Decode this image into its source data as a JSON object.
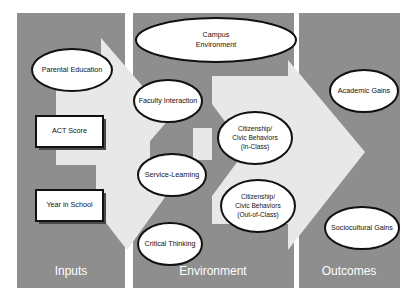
{
  "diagram": {
    "background_color": "#ffffff",
    "panel_fill_color": "#8e8e8e",
    "arrow_fill_color": "#e8e8e8",
    "node_fill_color": "#ffffff",
    "outline_color": "#111111",
    "panel_label_color": "#ffffff",
    "panels": [
      {
        "id": "inputs",
        "label": "Inputs",
        "x": 17,
        "y": 13,
        "width": 108,
        "height": 275
      },
      {
        "id": "environment",
        "label": "Environment",
        "x": 133,
        "y": 13,
        "width": 161,
        "height": 275
      },
      {
        "id": "outcomes",
        "label": "Outcomes",
        "x": 299,
        "y": 13,
        "width": 101,
        "height": 275
      }
    ],
    "arrows": [
      {
        "id": "inputs-to-environment-arrow",
        "label": "arrow from Inputs to Environment"
      },
      {
        "id": "environment-to-outcomes-arrow",
        "label": "arrow from Environment to Outcomes"
      }
    ],
    "nodes": [
      {
        "id": "parental-education",
        "shape": "ellipse",
        "panel": "inputs",
        "lines": [
          "Parental Education"
        ],
        "cx": 72,
        "cy": 70,
        "rx": 40,
        "ry": 21,
        "font_size": 7.2
      },
      {
        "id": "act-score",
        "shape": "rect",
        "panel": "inputs",
        "lines": [
          "ACT Score"
        ],
        "x": 36,
        "y": 116,
        "width": 67,
        "height": 31,
        "font_size": 7.2
      },
      {
        "id": "year-in-school",
        "shape": "rect",
        "panel": "inputs",
        "lines": [
          "Year in School"
        ],
        "x": 36,
        "y": 190,
        "width": 67,
        "height": 31,
        "font_size": 7.2
      },
      {
        "id": "campus-environment",
        "shape": "ellipse",
        "panel": "environment",
        "lines": [
          "Campus",
          "Environment"
        ],
        "cx": 216,
        "cy": 40,
        "rx": 80,
        "ry": 22,
        "font_size": 7.2
      },
      {
        "id": "faculty-interaction",
        "shape": "ellipse",
        "panel": "environment",
        "lines": [
          "Faculty Interaction"
        ],
        "cx": 168,
        "cy": 101,
        "rx": 34,
        "ry": 21,
        "font_size": 7.2
      },
      {
        "id": "service-learning",
        "shape": "ellipse",
        "panel": "environment",
        "lines": [
          "Service-Learning"
        ],
        "cx": 172,
        "cy": 175,
        "rx": 34,
        "ry": 21,
        "font_size": 7.2
      },
      {
        "id": "critical-thinking",
        "shape": "ellipse",
        "panel": "environment",
        "lines": [
          "Critical Thinking"
        ],
        "cx": 170,
        "cy": 244,
        "rx": 32,
        "ry": 21,
        "font_size": 7.2
      },
      {
        "id": "citizenship-civic-behaviors-in-class",
        "shape": "ellipse",
        "panel": "environment",
        "lines": [
          "Citizenship/",
          "Civic Behaviors",
          "(In-Class)"
        ],
        "cx": 255,
        "cy": 138,
        "rx": 37,
        "ry": 26,
        "font_size": 6.6
      },
      {
        "id": "citizenship-civic-behaviors-out-of-class",
        "shape": "ellipse",
        "panel": "environment",
        "lines": [
          "Citizenship/",
          "Civic Behaviors",
          "(Out-of-Class)"
        ],
        "cx": 258,
        "cy": 206,
        "rx": 37,
        "ry": 26,
        "font_size": 6.6
      },
      {
        "id": "academic-gains",
        "shape": "ellipse",
        "panel": "outcomes",
        "lines": [
          "Academic Gains"
        ],
        "cx": 364,
        "cy": 91,
        "rx": 34,
        "ry": 21,
        "font_size": 7.2
      },
      {
        "id": "sociocultural-gains",
        "shape": "ellipse",
        "panel": "outcomes",
        "lines": [
          "Sociocultural Gains"
        ],
        "cx": 362,
        "cy": 228,
        "rx": 37,
        "ry": 21,
        "font_size": 7.2
      }
    ],
    "panel_label_positions": [
      {
        "id": "inputs",
        "x": 71,
        "y": 272,
        "font_size": 12
      },
      {
        "id": "environment",
        "x": 213,
        "y": 272,
        "font_size": 12
      },
      {
        "id": "outcomes",
        "x": 349,
        "y": 272,
        "font_size": 12
      }
    ]
  }
}
